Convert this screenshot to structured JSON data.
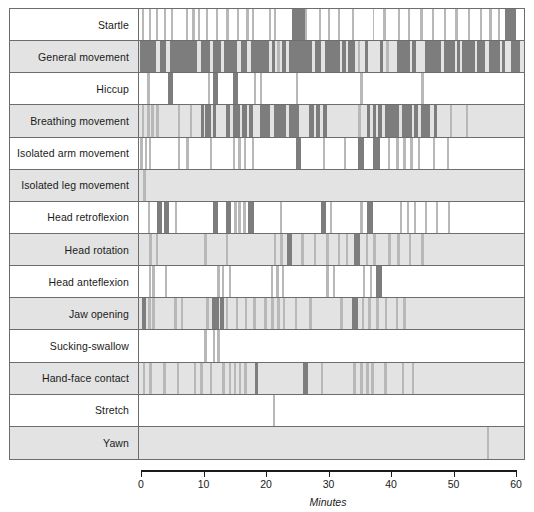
{
  "figure": {
    "background_color": "#ffffff",
    "frame_color": "#6d6d6d",
    "row_alt_color": "#e3e3e3",
    "bar_color_dark": "#7d7d7d",
    "bar_color_light": "#b8b8b8"
  },
  "axis": {
    "label": "Minutes",
    "ticks": [
      0,
      10,
      20,
      30,
      40,
      50,
      60
    ],
    "tick_labels": [
      "0",
      "10",
      "20",
      "30",
      "40",
      "50",
      "60"
    ],
    "min": 0,
    "max": 60,
    "units": "minutes"
  },
  "chart_data": {
    "type": "bar",
    "subtype": "event-raster-ethogram",
    "xlabel": "Minutes",
    "ylabel": "",
    "xlim": [
      0,
      60
    ],
    "grid": false,
    "legend": null,
    "categories": [
      "Startle",
      "General movement",
      "Hiccup",
      "Breathing movement",
      "Isolated arm movement",
      "Isolated leg movement",
      "Head retroflexion",
      "Head rotation",
      "Head anteflexion",
      "Jaw opening",
      "Sucking-swallow",
      "Hand-face contact",
      "Stretch",
      "Yawn"
    ],
    "series": [
      {
        "name": "Startle",
        "row_shading": "light",
        "events": [
          [
            0.5,
            0.35
          ],
          [
            1.5,
            0.3
          ],
          [
            2.6,
            0.35
          ],
          [
            3.9,
            0.3
          ],
          [
            5.0,
            0.35
          ],
          [
            7.4,
            0.3
          ],
          [
            8.3,
            0.4
          ],
          [
            9.2,
            0.35
          ],
          [
            10.4,
            0.3
          ],
          [
            12.0,
            0.35
          ],
          [
            13.6,
            0.35
          ],
          [
            15.3,
            0.3
          ],
          [
            16.6,
            0.5
          ],
          [
            17.6,
            0.35
          ],
          [
            20.2,
            0.4
          ],
          [
            21.0,
            0.35
          ],
          [
            23.9,
            1.9
          ],
          [
            25.8,
            0.4
          ],
          [
            28.0,
            0.35
          ],
          [
            29.4,
            0.4
          ],
          [
            31.0,
            0.35
          ],
          [
            33.2,
            0.35
          ],
          [
            36.4,
            0.3
          ],
          [
            38.1,
            0.35
          ],
          [
            40.3,
            0.35
          ],
          [
            41.9,
            0.35
          ],
          [
            43.8,
            0.4
          ],
          [
            45.7,
            0.35
          ],
          [
            47.5,
            0.35
          ],
          [
            49.3,
            0.35
          ],
          [
            51.3,
            0.35
          ],
          [
            53.1,
            0.4
          ],
          [
            54.6,
            0.4
          ],
          [
            55.9,
            0.35
          ],
          [
            57.0,
            1.8
          ]
        ]
      },
      {
        "name": "General movement",
        "row_shading": "dark",
        "events": [
          [
            0.2,
            2.4
          ],
          [
            3.3,
            0.9
          ],
          [
            4.9,
            4.1
          ],
          [
            9.6,
            1.5
          ],
          [
            11.5,
            1.3
          ],
          [
            13.2,
            2.1
          ],
          [
            15.9,
            1.0
          ],
          [
            17.4,
            2.9
          ],
          [
            20.7,
            0.5
          ],
          [
            21.5,
            0.4
          ],
          [
            22.3,
            0.6
          ],
          [
            23.4,
            3.5
          ],
          [
            27.4,
            1.0
          ],
          [
            29.0,
            2.3
          ],
          [
            31.7,
            0.5
          ],
          [
            32.5,
            1.1
          ],
          [
            34.1,
            0.4
          ],
          [
            35.2,
            0.5
          ],
          [
            37.6,
            0.5
          ],
          [
            38.5,
            0.4
          ],
          [
            40.2,
            2.0
          ],
          [
            42.6,
            0.6
          ],
          [
            44.5,
            2.6
          ],
          [
            47.6,
            1.6
          ],
          [
            49.5,
            0.5
          ],
          [
            50.4,
            1.9
          ],
          [
            52.7,
            1.3
          ],
          [
            54.5,
            1.7
          ],
          [
            56.6,
            0.5
          ],
          [
            57.9,
            1.5
          ]
        ]
      },
      {
        "name": "Hiccup",
        "row_shading": "light",
        "events": [
          [
            1.3,
            0.35
          ],
          [
            4.5,
            0.8
          ],
          [
            10.7,
            0.4
          ],
          [
            11.5,
            0.8
          ],
          [
            14.6,
            0.9
          ],
          [
            17.9,
            0.35
          ],
          [
            18.8,
            0.35
          ],
          [
            24.5,
            0.35
          ],
          [
            34.5,
            0.35
          ],
          [
            44.0,
            0.35
          ]
        ]
      },
      {
        "name": "Breathing movement",
        "row_shading": "dark",
        "events": [
          [
            0.4,
            0.4
          ],
          [
            1.2,
            0.45
          ],
          [
            1.9,
            0.45
          ],
          [
            2.7,
            0.45
          ],
          [
            6.0,
            0.35
          ],
          [
            7.9,
            0.4
          ],
          [
            9.6,
            0.6
          ],
          [
            10.3,
            0.9
          ],
          [
            11.5,
            0.5
          ],
          [
            13.5,
            0.7
          ],
          [
            14.6,
            1.2
          ],
          [
            16.1,
            0.7
          ],
          [
            17.2,
            0.5
          ],
          [
            18.8,
            1.6
          ],
          [
            21.0,
            1.9
          ],
          [
            23.3,
            1.7
          ],
          [
            26.5,
            0.7
          ],
          [
            27.6,
            0.6
          ],
          [
            28.7,
            0.6
          ],
          [
            34.2,
            0.45
          ],
          [
            35.5,
            0.5
          ],
          [
            36.4,
            0.5
          ],
          [
            37.3,
            0.6
          ],
          [
            38.3,
            2.2
          ],
          [
            41.0,
            1.5
          ],
          [
            42.9,
            0.6
          ],
          [
            43.9,
            1.4
          ],
          [
            45.9,
            0.5
          ],
          [
            48.4,
            0.35
          ],
          [
            51.0,
            0.35
          ]
        ]
      },
      {
        "name": "Isolated arm movement",
        "row_shading": "light",
        "events": [
          [
            0.2,
            0.4
          ],
          [
            0.9,
            0.4
          ],
          [
            1.5,
            0.4
          ],
          [
            6.1,
            0.35
          ],
          [
            7.4,
            0.35
          ],
          [
            11.0,
            0.35
          ],
          [
            14.6,
            0.35
          ],
          [
            15.5,
            0.35
          ],
          [
            16.3,
            0.35
          ],
          [
            17.6,
            0.4
          ],
          [
            24.4,
            0.9
          ],
          [
            28.7,
            0.35
          ],
          [
            31.9,
            0.35
          ],
          [
            34.1,
            1.0
          ],
          [
            36.5,
            1.0
          ],
          [
            38.8,
            0.35
          ],
          [
            40.1,
            0.35
          ],
          [
            41.2,
            0.35
          ],
          [
            42.3,
            0.35
          ],
          [
            43.5,
            0.35
          ],
          [
            45.8,
            0.35
          ],
          [
            48.0,
            0.35
          ]
        ]
      },
      {
        "name": "Isolated leg movement",
        "row_shading": "dark",
        "events": [
          [
            0.6,
            0.45
          ]
        ]
      },
      {
        "name": "Head retroflexion",
        "row_shading": "light",
        "events": [
          [
            1.4,
            0.35
          ],
          [
            2.8,
            0.85
          ],
          [
            3.9,
            0.85
          ],
          [
            5.6,
            0.35
          ],
          [
            11.5,
            0.85
          ],
          [
            13.6,
            0.7
          ],
          [
            14.8,
            0.4
          ],
          [
            15.5,
            0.4
          ],
          [
            16.2,
            0.4
          ],
          [
            17.0,
            0.85
          ],
          [
            22.0,
            0.35
          ],
          [
            28.3,
            0.85
          ],
          [
            29.7,
            0.4
          ],
          [
            34.5,
            0.4
          ],
          [
            35.6,
            0.9
          ],
          [
            40.6,
            0.35
          ],
          [
            41.7,
            0.35
          ],
          [
            42.8,
            0.35
          ],
          [
            44.5,
            0.35
          ],
          [
            46.3,
            0.35
          ],
          [
            48.1,
            0.35
          ]
        ]
      },
      {
        "name": "Head rotation",
        "row_shading": "dark",
        "events": [
          [
            1.6,
            0.4
          ],
          [
            2.6,
            0.4
          ],
          [
            10.2,
            0.4
          ],
          [
            13.5,
            0.4
          ],
          [
            21.0,
            0.4
          ],
          [
            22.0,
            0.4
          ],
          [
            23.0,
            0.85
          ],
          [
            25.3,
            0.4
          ],
          [
            27.2,
            0.4
          ],
          [
            29.2,
            0.4
          ],
          [
            31.0,
            0.4
          ],
          [
            32.2,
            0.4
          ],
          [
            33.5,
            0.9
          ],
          [
            35.3,
            0.4
          ],
          [
            36.5,
            0.4
          ],
          [
            38.8,
            0.4
          ],
          [
            40.2,
            0.4
          ],
          [
            42.0,
            0.4
          ],
          [
            44.0,
            0.4
          ]
        ]
      },
      {
        "name": "Head anteflexion",
        "row_shading": "light",
        "events": [
          [
            1.5,
            0.4
          ],
          [
            2.1,
            0.4
          ],
          [
            4.0,
            0.35
          ],
          [
            12.2,
            0.4
          ],
          [
            12.9,
            0.4
          ],
          [
            14.0,
            0.4
          ],
          [
            20.5,
            0.35
          ],
          [
            21.4,
            0.35
          ],
          [
            22.3,
            0.35
          ],
          [
            29.2,
            0.35
          ],
          [
            30.2,
            0.35
          ],
          [
            34.9,
            0.35
          ],
          [
            36.0,
            0.35
          ],
          [
            37.0,
            0.9
          ]
        ]
      },
      {
        "name": "Jaw opening",
        "row_shading": "dark",
        "events": [
          [
            0.4,
            0.7
          ],
          [
            1.4,
            0.4
          ],
          [
            2.1,
            0.4
          ],
          [
            5.5,
            0.4
          ],
          [
            6.5,
            0.4
          ],
          [
            10.5,
            0.4
          ],
          [
            11.3,
            1.1
          ],
          [
            12.7,
            0.5
          ],
          [
            13.5,
            0.4
          ],
          [
            15.1,
            0.4
          ],
          [
            16.5,
            0.4
          ],
          [
            17.8,
            0.4
          ],
          [
            19.5,
            0.4
          ],
          [
            20.6,
            0.4
          ],
          [
            21.5,
            0.4
          ],
          [
            22.4,
            0.4
          ],
          [
            24.3,
            0.4
          ],
          [
            26.5,
            0.4
          ],
          [
            31.4,
            0.4
          ],
          [
            33.2,
            1.0
          ],
          [
            34.7,
            0.4
          ],
          [
            35.7,
            0.4
          ],
          [
            37.0,
            0.4
          ],
          [
            38.3,
            0.4
          ],
          [
            40.0,
            0.4
          ],
          [
            41.2,
            0.4
          ]
        ]
      },
      {
        "name": "Sucking-swallow",
        "row_shading": "light",
        "events": [
          [
            10.2,
            0.4
          ],
          [
            11.5,
            0.35
          ],
          [
            12.2,
            0.35
          ]
        ]
      },
      {
        "name": "Hand-face contact",
        "row_shading": "dark",
        "events": [
          [
            0.6,
            0.4
          ],
          [
            1.6,
            0.4
          ],
          [
            3.8,
            0.35
          ],
          [
            5.9,
            0.35
          ],
          [
            8.5,
            0.35
          ],
          [
            9.5,
            0.4
          ],
          [
            11.0,
            0.4
          ],
          [
            13.0,
            0.35
          ],
          [
            14.0,
            0.35
          ],
          [
            14.8,
            0.35
          ],
          [
            15.6,
            0.35
          ],
          [
            16.4,
            0.4
          ],
          [
            18.1,
            0.5
          ],
          [
            25.6,
            0.7
          ],
          [
            28.3,
            0.35
          ],
          [
            33.4,
            0.4
          ],
          [
            34.5,
            0.4
          ],
          [
            35.4,
            0.4
          ],
          [
            36.2,
            0.4
          ],
          [
            38.2,
            0.4
          ],
          [
            41.0,
            0.35
          ],
          [
            42.5,
            0.35
          ]
        ]
      },
      {
        "name": "Stretch",
        "row_shading": "light",
        "events": [
          [
            20.9,
            0.35
          ]
        ]
      },
      {
        "name": "Yawn",
        "row_shading": "dark",
        "events": [
          [
            54.2,
            0.35
          ]
        ]
      }
    ]
  }
}
